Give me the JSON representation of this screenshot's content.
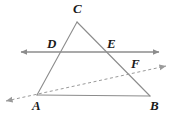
{
  "figure": {
    "type": "geometry-diagram",
    "background_color": "#ffffff",
    "stroke_color": "#8c8c8c",
    "dashed_stroke_color": "#9a9a9a",
    "label_color": "#1a1a1a",
    "width": 180,
    "height": 121
  },
  "points": {
    "A": {
      "label": "A",
      "x": 37,
      "y": 95,
      "label_x": 32,
      "label_y": 99
    },
    "B": {
      "label": "B",
      "x": 150,
      "y": 96,
      "label_x": 150,
      "label_y": 99
    },
    "C": {
      "label": "C",
      "x": 77,
      "y": 22,
      "label_x": 73,
      "label_y": 2
    },
    "D": {
      "label": "D",
      "x": 58,
      "y": 52,
      "label_x": 47,
      "label_y": 37
    },
    "E": {
      "label": "E",
      "x": 108,
      "y": 52,
      "label_x": 107,
      "label_y": 37
    },
    "F": {
      "label": "F",
      "x": 139,
      "y": 70,
      "label_x": 131,
      "label_y": 57
    }
  },
  "segments": [
    {
      "name": "side-AC",
      "from": "A",
      "to": "C",
      "style": "solid"
    },
    {
      "name": "side-CB",
      "from": "C",
      "to": "B",
      "style": "solid"
    },
    {
      "name": "side-AB",
      "from": "A",
      "to": "B",
      "style": "solid"
    }
  ],
  "lines": [
    {
      "name": "line-DE",
      "style": "solid",
      "through": [
        "D",
        "E"
      ],
      "x1": 21,
      "y1": 52,
      "x2": 159,
      "y2": 52,
      "arrow_start": true,
      "arrow_end": true
    },
    {
      "name": "ray-AF",
      "style": "dashed",
      "through": [
        "A",
        "F"
      ],
      "x1": 6,
      "y1": 101,
      "x2": 166,
      "y2": 66,
      "arrow_start": true,
      "arrow_end": true
    }
  ],
  "labels": [
    "C",
    "D",
    "E",
    "F",
    "A",
    "B"
  ]
}
